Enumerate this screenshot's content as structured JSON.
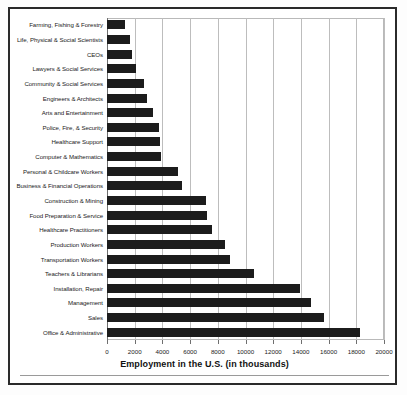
{
  "chart_data": {
    "type": "bar",
    "orientation": "horizontal",
    "title": "",
    "xlabel": "Employment in the U.S. (in thousands)",
    "ylabel": "",
    "xlim": [
      0,
      20000
    ],
    "xticks": [
      0,
      2000,
      4000,
      6000,
      8000,
      10000,
      12000,
      14000,
      16000,
      18000,
      20000
    ],
    "grid": "vertical",
    "legend": "none",
    "bar_color": "#1c1c1c",
    "categories": [
      "Farming, Fishing & Forestry",
      "Life, Physical & Social Scientists",
      "CEOs",
      "Lawyers & Social Services",
      "Community & Social Services",
      "Engineers & Architects",
      "Arts and Entertainment",
      "Police, Fire, & Security",
      "Healthcare Support",
      "Computer & Mathematics",
      "Personal & Childcare Workers",
      "Business & Financial Operations",
      "Construction & Mining",
      "Food Preparation & Service",
      "Healthcare Practitioners",
      "Production Workers",
      "Transportation Workers",
      "Teachers & Librarians",
      "Installation, Repair",
      "Management",
      "Sales",
      "Office & Administrative"
    ],
    "values": [
      1300,
      1650,
      1800,
      2100,
      2650,
      2900,
      3300,
      3750,
      3800,
      3900,
      5100,
      5400,
      7150,
      7200,
      7600,
      8500,
      8900,
      10600,
      13900,
      14700,
      15700,
      18300
    ]
  }
}
